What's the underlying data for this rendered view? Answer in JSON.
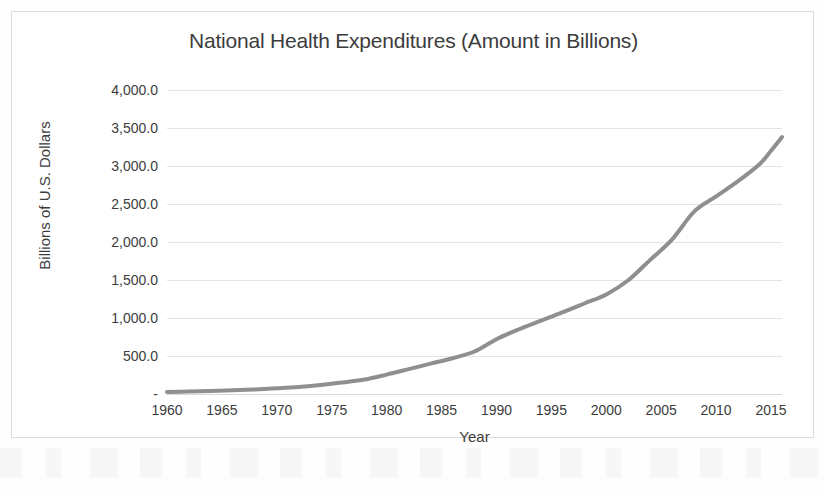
{
  "document": {
    "background_color": "#ffffff",
    "frame_border_color": "#dcdcdc"
  },
  "chart_data": {
    "type": "line",
    "title": "National Health Expenditures (Amount in Billions)",
    "xlabel": "Year",
    "ylabel": "Billions of U.S. Dollars",
    "xlim": [
      1960,
      2016
    ],
    "ylim": [
      0,
      4000
    ],
    "grid": "horizontal",
    "legend": "none",
    "line_color": "#8f8f8f",
    "line_width": 4,
    "y_tick_labels": [
      "4,000.0",
      "3,500.0",
      "3,000.0",
      "2,500.0",
      "2,000.0",
      "1,500.0",
      "1,000.0",
      "500.0",
      "-"
    ],
    "y_tick_values": [
      4000,
      3500,
      3000,
      2500,
      2000,
      1500,
      1000,
      500,
      0
    ],
    "x_tick_labels": [
      "1960",
      "1965",
      "1970",
      "1975",
      "1980",
      "1985",
      "1990",
      "1995",
      "2000",
      "2005",
      "2010",
      "2015"
    ],
    "x_tick_values": [
      1960,
      1965,
      1970,
      1975,
      1980,
      1985,
      1990,
      1995,
      2000,
      2005,
      2010,
      2015
    ],
    "series": [
      {
        "name": "National Health Expenditures",
        "x": [
          1960,
          1962,
          1964,
          1966,
          1968,
          1970,
          1972,
          1974,
          1976,
          1978,
          1980,
          1982,
          1984,
          1986,
          1988,
          1990,
          1992,
          1994,
          1996,
          1998,
          2000,
          2002,
          2004,
          2006,
          2008,
          2010,
          2012,
          2014,
          2015,
          2016
        ],
        "values": [
          27,
          32,
          39,
          48,
          60,
          75,
          93,
          118,
          152,
          190,
          255,
          327,
          400,
          471,
          559,
          721,
          849,
          962,
          1073,
          1191,
          1310,
          1496,
          1765,
          2035,
          2400,
          2600,
          2800,
          3030,
          3200,
          3380
        ]
      }
    ]
  }
}
